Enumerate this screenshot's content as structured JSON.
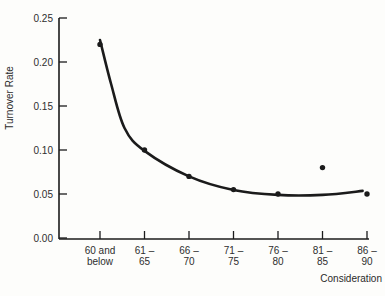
{
  "figure": {
    "background": "#fdfdfb",
    "ink": "#1b1b1b",
    "text_color": "#2e2e2e"
  },
  "chart_data": {
    "type": "scatter",
    "title": "",
    "xlabel": "Consideration",
    "ylabel": "Turnover Rate",
    "categories": [
      "60 and below",
      "61-65",
      "66-70",
      "71-75",
      "76-80",
      "81-85",
      "86-90"
    ],
    "category_tick_lines": [
      [
        "60 and",
        "below"
      ],
      [
        "61 –",
        "65"
      ],
      [
        "66 –",
        "70"
      ],
      [
        "71 –",
        "75"
      ],
      [
        "76 –",
        "80"
      ],
      [
        "81 –",
        "85"
      ],
      [
        "86 –",
        "90"
      ]
    ],
    "values": [
      0.22,
      0.1,
      0.07,
      0.055,
      0.05,
      0.08,
      0.05
    ],
    "ylim": [
      0.0,
      0.25
    ],
    "yticks": [
      0.0,
      0.05,
      0.1,
      0.15,
      0.2,
      0.25
    ],
    "ytick_labels": [
      "0.00",
      "0.05",
      "0.10",
      "0.15",
      "0.20",
      "0.25"
    ],
    "grid": false,
    "legend": "none",
    "annotations": [],
    "fit_curve_points": [
      [
        0.0,
        0.225
      ],
      [
        0.25,
        0.175
      ],
      [
        0.55,
        0.125
      ],
      [
        1.0,
        0.099
      ],
      [
        2.0,
        0.07
      ],
      [
        3.0,
        0.0545
      ],
      [
        4.0,
        0.049
      ],
      [
        5.0,
        0.049
      ],
      [
        5.9,
        0.0535
      ]
    ]
  }
}
